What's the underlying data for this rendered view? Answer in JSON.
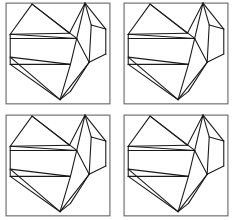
{
  "figure": {
    "background_color": "#ffffff",
    "line_color": "#1a1a1a",
    "frame_color": "#6b6b6b",
    "width": 234,
    "height": 220,
    "layout": {
      "rows": 2,
      "columns": 2,
      "panel_count": 4
    }
  },
  "panels": [
    {
      "id": "panel-top-left",
      "position": "top-left",
      "row": 1,
      "column": 1,
      "label": "",
      "frame": {
        "x": 4,
        "y": 3,
        "width": 100,
        "height": 97
      }
    },
    {
      "id": "panel-top-right",
      "position": "top-right",
      "row": 1,
      "column": 2,
      "label": "",
      "frame": {
        "x": 4,
        "y": 3,
        "width": 100,
        "height": 97
      }
    },
    {
      "id": "panel-bottom-left",
      "position": "bottom-left",
      "row": 2,
      "column": 1,
      "label": "",
      "frame": {
        "x": 4,
        "y": 3,
        "width": 100,
        "height": 97
      }
    },
    {
      "id": "panel-bottom-right",
      "position": "bottom-right",
      "row": 2,
      "column": 2,
      "label": "",
      "frame": {
        "x": 4,
        "y": 3,
        "width": 100,
        "height": 97
      }
    }
  ],
  "crease_pattern": {
    "name": "heart-crease-pattern",
    "viewbox": "0 0 108 104",
    "description": "Straight-line origami crease pattern forming a heart outline with internal folds",
    "vertices": {
      "left_hub": [
        8,
        33
      ],
      "left_hub_lower": [
        8,
        55
      ],
      "left_apex": [
        29,
        4
      ],
      "right_apex": [
        80,
        3
      ],
      "center_valley": [
        65,
        32
      ],
      "mid_left_chord": [
        8,
        37
      ],
      "mid_right_chord": [
        72,
        37
      ],
      "low_left_chord": [
        8,
        62
      ],
      "low_right_chord": [
        66,
        62
      ],
      "bottom_point": [
        56,
        96
      ],
      "right_edge_upper": [
        100,
        28
      ],
      "right_edge_lower": [
        100,
        52
      ],
      "inner_right_upper": [
        86,
        24
      ],
      "inner_right_lower": [
        84,
        60
      ]
    },
    "segments": [
      [
        29,
        4,
        8,
        33
      ],
      [
        29,
        4,
        65,
        32
      ],
      [
        29,
        4,
        72,
        37
      ],
      [
        8,
        33,
        65,
        32
      ],
      [
        8,
        33,
        72,
        37
      ],
      [
        8,
        37,
        72,
        37
      ],
      [
        65,
        32,
        80,
        3
      ],
      [
        80,
        3,
        72,
        37
      ],
      [
        80,
        3,
        86,
        24
      ],
      [
        80,
        3,
        100,
        28
      ],
      [
        86,
        24,
        100,
        28
      ],
      [
        86,
        24,
        84,
        60
      ],
      [
        72,
        37,
        84,
        60
      ],
      [
        100,
        28,
        100,
        52
      ],
      [
        100,
        52,
        84,
        60
      ],
      [
        8,
        55,
        66,
        62
      ],
      [
        8,
        62,
        66,
        62
      ],
      [
        8,
        55,
        56,
        96
      ],
      [
        8,
        62,
        56,
        96
      ],
      [
        66,
        62,
        56,
        96
      ],
      [
        84,
        60,
        56,
        96
      ],
      [
        84,
        60,
        66,
        88
      ],
      [
        56,
        96,
        66,
        88
      ],
      [
        8,
        33,
        8,
        62
      ],
      [
        72,
        37,
        66,
        62
      ]
    ]
  }
}
